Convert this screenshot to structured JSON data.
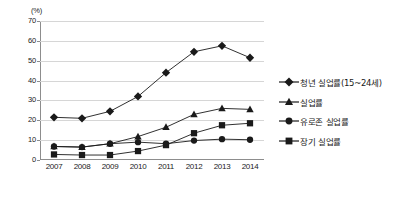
{
  "chart_data": {
    "type": "line",
    "title": "",
    "xlabel": "",
    "ylabel": "(%)",
    "unit_label": "(%)",
    "categories": [
      "2007",
      "2008",
      "2009",
      "2010",
      "2011",
      "2012",
      "2013",
      "2014"
    ],
    "ylim": [
      0,
      70
    ],
    "yticks": [
      "0",
      "10",
      "20",
      "30",
      "40",
      "50",
      "60",
      "70"
    ],
    "ytick_values": [
      0,
      10,
      20,
      30,
      40,
      50,
      60,
      70
    ],
    "grid": true,
    "legend_position": "right",
    "series": [
      {
        "name": "청년 실업률(15~24세)",
        "marker": "diamond",
        "color": "#1a1a1a",
        "values": [
          21.5,
          21.0,
          24.5,
          32.0,
          44.0,
          54.5,
          57.5,
          51.5
        ]
      },
      {
        "name": "실업률",
        "marker": "triangle",
        "color": "#1a1a1a",
        "values": [
          6.8,
          6.5,
          8.2,
          11.8,
          16.5,
          23.0,
          26.0,
          25.5
        ]
      },
      {
        "name": "유로존 실업률",
        "marker": "circle",
        "color": "#1a1a1a",
        "values": [
          6.8,
          6.5,
          8.2,
          9.0,
          8.2,
          9.8,
          10.5,
          10.2
        ]
      },
      {
        "name": "장기 실업률",
        "marker": "square",
        "color": "#1a1a1a",
        "values": [
          2.8,
          2.5,
          2.5,
          4.5,
          7.5,
          13.5,
          17.5,
          18.5
        ]
      }
    ]
  },
  "legend": {
    "items": [
      {
        "label": "청년 실업률(15~24세)",
        "marker": "diamond"
      },
      {
        "label": "실업률",
        "marker": "triangle"
      },
      {
        "label": "유로존 실업률",
        "marker": "circle"
      },
      {
        "label": "장기 실업률",
        "marker": "square"
      }
    ]
  },
  "colors": {
    "series": "#1a1a1a",
    "gridline": "#d6d6d6",
    "axis": "#8d8d8d",
    "background": "#ffffff"
  }
}
